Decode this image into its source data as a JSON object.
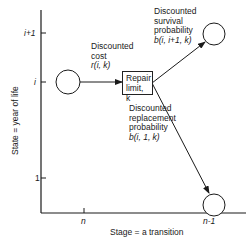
{
  "axes": {
    "y_label": "State = year of life",
    "x_label": "Stage = a transition",
    "y_ticks": [
      "i+1",
      "i",
      "1"
    ],
    "x_ticks": [
      "n",
      "n-1"
    ]
  },
  "nodes": {
    "left": "state i at stage n",
    "upper_right": "state i+1 at stage n-1",
    "lower_right": "state 1 at stage n-1"
  },
  "decision_box": {
    "line1": "Repair",
    "line2": "limit, k"
  },
  "labels": {
    "cost": {
      "line1": "Discounted",
      "line2": "cost",
      "line3": "r(i, k)"
    },
    "survival": {
      "line1": "Discounted",
      "line2": "survival",
      "line3": "probability",
      "line4": "b(i, i+1, k)"
    },
    "replacement": {
      "line1": "Discounted",
      "line2": "replacement",
      "line3": "probability",
      "line4": "b(i, 1, k)"
    }
  },
  "colors": {
    "ink": "#1a1a1a",
    "background": "#ffffff"
  }
}
